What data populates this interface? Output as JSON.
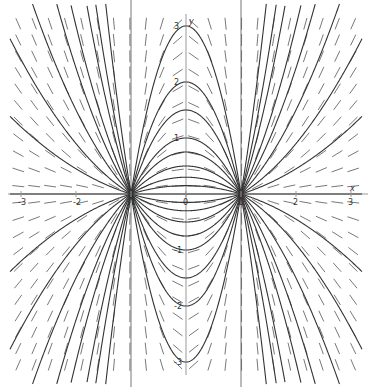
{
  "chart_data": {
    "type": "slope_field",
    "title": "",
    "equation": "dy/dx = 2xy/(x^2 - 1)",
    "solution_family": "y = C(x^2 - 1)",
    "xlabel": "x",
    "ylabel": "y",
    "xlim": [
      -3.2,
      3.2
    ],
    "ylim": [
      -3.2,
      3.2
    ],
    "grid": false,
    "legend": null,
    "x_ticks": [
      -3,
      -2,
      -1,
      0,
      1,
      2,
      3
    ],
    "x_tick_labels": [
      "-3",
      "-2",
      "-1",
      "0",
      "1",
      "2",
      "3"
    ],
    "y_ticks": [
      -3,
      -2,
      -1,
      1,
      2,
      3
    ],
    "y_tick_labels": [
      "-3",
      "-2",
      "-1",
      "1",
      "2",
      "3"
    ],
    "vertical_asymptote_lines": [
      -1,
      1
    ],
    "nodes": [
      {
        "x": -1,
        "y": 0
      },
      {
        "x": 1,
        "y": 0
      }
    ],
    "slope_grid_step": 0.29,
    "solution_C_values": [
      -3,
      -2,
      -1.5,
      -1,
      -0.75,
      -0.5,
      -0.3,
      -0.15,
      0,
      0.15,
      0.3,
      0.5,
      0.75,
      1,
      1.5,
      2,
      3
    ],
    "colors": {
      "axis": "#999999",
      "slope_marks": "#555555",
      "solution_curves": "#333333",
      "asymptote_lines": "#666666",
      "background": "#ffffff"
    },
    "pixel_mapping": {
      "origin_px": [
        186,
        194
      ],
      "px_per_unit_x": 55,
      "px_per_unit_y": 56
    }
  }
}
